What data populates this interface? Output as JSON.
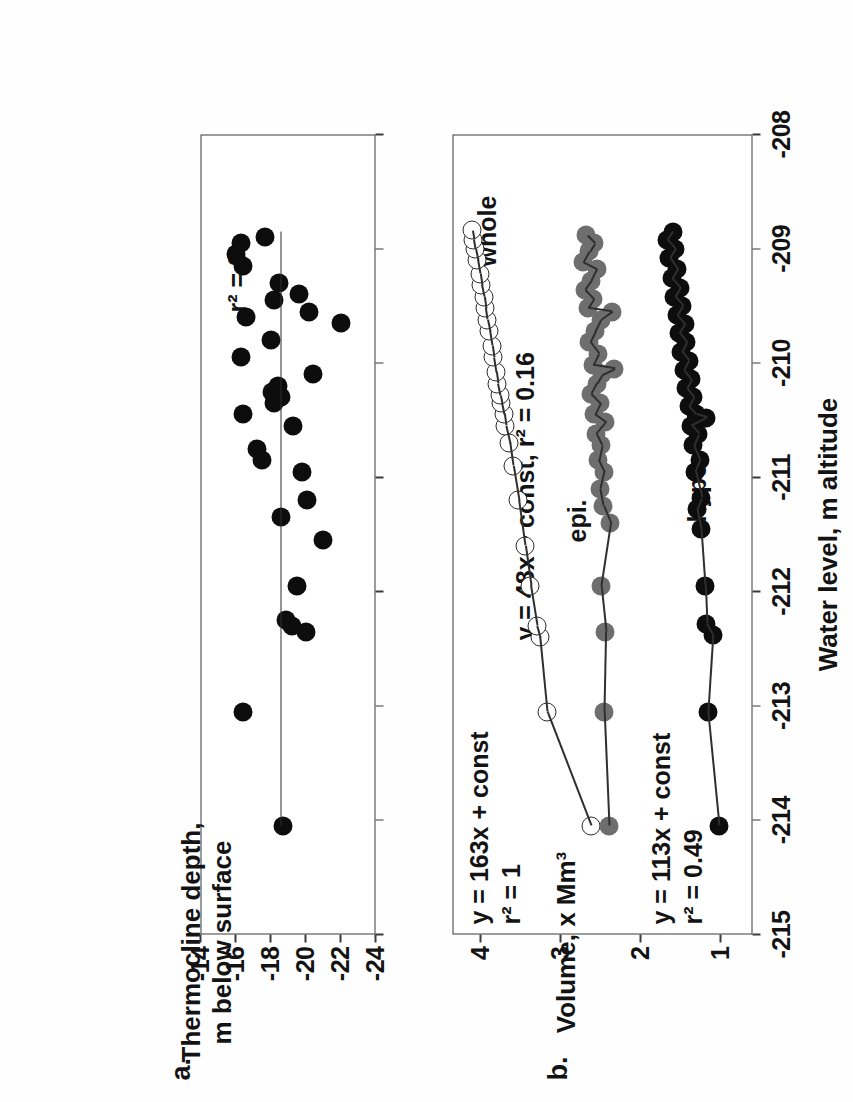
{
  "figure": {
    "orientation": "rotated-90-ccw",
    "shared_x_axis": {
      "title": "Water level, m altitude",
      "ticks": [
        "-215",
        "-214",
        "-213",
        "-212",
        "-211",
        "-210",
        "-209",
        "-208"
      ],
      "min": -215,
      "max": -208
    },
    "panels": [
      {
        "letter": "a.",
        "y_axis": {
          "title_line1": "Thermocline depth,",
          "title_line2": "m below surface",
          "ticks": [
            "-14",
            "-16",
            "-18",
            "-20",
            "-22",
            "-24"
          ],
          "min": -24,
          "max": -14
        },
        "annotations": [
          {
            "name": "r-squared",
            "text": "r² = 0"
          }
        ]
      },
      {
        "letter": "b.",
        "y_axis": {
          "title": "Volume, x Mm³",
          "ticks": [
            "1",
            "2",
            "3",
            "4"
          ],
          "min": 0.6,
          "max": 4.35
        },
        "annotations": [
          {
            "name": "series-label-whole",
            "text": "whole"
          },
          {
            "name": "series-label-epi",
            "text": "epi."
          },
          {
            "name": "series-label-hypo",
            "text": "hypo."
          },
          {
            "name": "fit-whole-eq",
            "text": "y = 163x + const"
          },
          {
            "name": "fit-whole-r2",
            "text": "r² = 1"
          },
          {
            "name": "fit-epi",
            "text": "y = 48x + const, r² = 0.16"
          },
          {
            "name": "fit-hypo-eq",
            "text": "y = 113x + const"
          },
          {
            "name": "fit-hypo-r2",
            "text": "r² = 0.49"
          }
        ]
      }
    ]
  },
  "colors": {
    "marker_black": "#0d0d0d",
    "marker_gray": "#6e6e6e",
    "marker_open_fill": "#ffffff",
    "marker_open_stroke": "#2b2b2b",
    "axis": "#3a3a3a",
    "text": "#131313",
    "background": "#ffffff"
  },
  "chart_data": [
    {
      "type": "scatter",
      "panel": "a",
      "title": "",
      "xlabel": "Water level, m altitude",
      "ylabel": "Thermocline depth, m below surface",
      "xlim": [
        -215,
        -208
      ],
      "ylim": [
        -24,
        -14
      ],
      "grid": false,
      "legend": "none",
      "annotations": [
        "r² = 0"
      ],
      "series": [
        {
          "name": "thermocline depth",
          "marker": "filled-circle-black",
          "fit_line": {
            "slope": 0,
            "r2": 0,
            "label": "r² = 0"
          },
          "points": [
            [
              -214.05,
              -18.7
            ],
            [
              -213.05,
              -16.4
            ],
            [
              -212.35,
              -20.0
            ],
            [
              -212.3,
              -19.2
            ],
            [
              -212.25,
              -18.9
            ],
            [
              -211.95,
              -19.5
            ],
            [
              -211.55,
              -21.0
            ],
            [
              -211.35,
              -18.6
            ],
            [
              -211.2,
              -20.1
            ],
            [
              -210.95,
              -19.8
            ],
            [
              -210.85,
              -17.5
            ],
            [
              -210.75,
              -17.2
            ],
            [
              -210.55,
              -19.3
            ],
            [
              -210.45,
              -16.4
            ],
            [
              -210.35,
              -18.2
            ],
            [
              -210.3,
              -18.6
            ],
            [
              -210.25,
              -18.1
            ],
            [
              -210.2,
              -18.4
            ],
            [
              -210.1,
              -20.4
            ],
            [
              -209.95,
              -16.3
            ],
            [
              -209.8,
              -18.0
            ],
            [
              -209.65,
              -22.0
            ],
            [
              -209.6,
              -16.6
            ],
            [
              -209.55,
              -20.2
            ],
            [
              -209.45,
              -18.2
            ],
            [
              -209.4,
              -19.6
            ],
            [
              -209.3,
              -18.5
            ],
            [
              -209.15,
              -16.4
            ],
            [
              -209.05,
              -16.0
            ],
            [
              -208.95,
              -16.3
            ],
            [
              -208.9,
              -17.7
            ]
          ]
        }
      ]
    },
    {
      "type": "scatter",
      "panel": "b",
      "title": "",
      "xlabel": "Water level, m altitude",
      "ylabel": "Volume, x Mm³",
      "xlim": [
        -215,
        -208
      ],
      "ylim": [
        0.6,
        4.35
      ],
      "grid": false,
      "legend": "inline-labels",
      "series": [
        {
          "name": "whole",
          "marker": "open-circle",
          "fit_line": {
            "slope": 163,
            "r2": 1,
            "label": "y = 163x + const, r² = 1"
          },
          "points": [
            [
              -214.05,
              2.62
            ],
            [
              -213.05,
              3.17
            ],
            [
              -212.4,
              3.26
            ],
            [
              -212.3,
              3.3
            ],
            [
              -211.95,
              3.38
            ],
            [
              -211.6,
              3.45
            ],
            [
              -211.2,
              3.53
            ],
            [
              -210.9,
              3.6
            ],
            [
              -210.7,
              3.64
            ],
            [
              -210.55,
              3.69
            ],
            [
              -210.45,
              3.71
            ],
            [
              -210.35,
              3.74
            ],
            [
              -210.28,
              3.76
            ],
            [
              -210.18,
              3.79
            ],
            [
              -210.08,
              3.81
            ],
            [
              -209.95,
              3.84
            ],
            [
              -209.85,
              3.86
            ],
            [
              -209.72,
              3.89
            ],
            [
              -209.62,
              3.92
            ],
            [
              -209.52,
              3.94
            ],
            [
              -209.42,
              3.96
            ],
            [
              -209.32,
              3.99
            ],
            [
              -209.22,
              4.01
            ],
            [
              -209.1,
              4.04
            ],
            [
              -209.0,
              4.07
            ],
            [
              -208.92,
              4.09
            ],
            [
              -208.84,
              4.11
            ]
          ]
        },
        {
          "name": "epi.",
          "marker": "filled-circle-gray",
          "fit_line": {
            "slope": 48,
            "r2": 0.16,
            "label": "y = 48x + const, r² = 0.16"
          },
          "points": [
            [
              -214.05,
              2.4
            ],
            [
              -213.05,
              2.46
            ],
            [
              -212.35,
              2.44
            ],
            [
              -211.95,
              2.5
            ],
            [
              -211.4,
              2.38
            ],
            [
              -211.25,
              2.47
            ],
            [
              -211.1,
              2.51
            ],
            [
              -210.95,
              2.46
            ],
            [
              -210.85,
              2.53
            ],
            [
              -210.72,
              2.49
            ],
            [
              -210.62,
              2.56
            ],
            [
              -210.52,
              2.44
            ],
            [
              -210.45,
              2.58
            ],
            [
              -210.35,
              2.51
            ],
            [
              -210.27,
              2.62
            ],
            [
              -210.18,
              2.55
            ],
            [
              -210.1,
              2.48
            ],
            [
              -210.02,
              2.6
            ],
            [
              -209.92,
              2.53
            ],
            [
              -209.82,
              2.64
            ],
            [
              -209.72,
              2.57
            ],
            [
              -209.62,
              2.5
            ],
            [
              -209.52,
              2.66
            ],
            [
              -209.44,
              2.59
            ],
            [
              -209.36,
              2.7
            ],
            [
              -209.28,
              2.62
            ],
            [
              -209.18,
              2.55
            ],
            [
              -209.12,
              2.72
            ],
            [
              -209.02,
              2.64
            ],
            [
              -208.95,
              2.58
            ],
            [
              -208.88,
              2.68
            ],
            [
              -210.05,
              2.33
            ],
            [
              -209.55,
              2.36
            ]
          ]
        },
        {
          "name": "hypo.",
          "marker": "filled-circle-black",
          "fit_line": {
            "slope": 113,
            "r2": 0.49,
            "label": "y = 113x + const, r² = 0.49"
          },
          "points": [
            [
              -214.05,
              1.02
            ],
            [
              -213.05,
              1.16
            ],
            [
              -212.38,
              1.1
            ],
            [
              -212.28,
              1.18
            ],
            [
              -211.95,
              1.2
            ],
            [
              -211.45,
              1.25
            ],
            [
              -211.28,
              1.3
            ],
            [
              -211.18,
              1.24
            ],
            [
              -210.95,
              1.32
            ],
            [
              -210.85,
              1.26
            ],
            [
              -210.72,
              1.34
            ],
            [
              -210.62,
              1.28
            ],
            [
              -210.55,
              1.37
            ],
            [
              -210.45,
              1.31
            ],
            [
              -210.38,
              1.4
            ],
            [
              -210.3,
              1.34
            ],
            [
              -210.22,
              1.43
            ],
            [
              -210.14,
              1.37
            ],
            [
              -210.06,
              1.46
            ],
            [
              -209.98,
              1.4
            ],
            [
              -209.9,
              1.49
            ],
            [
              -209.82,
              1.43
            ],
            [
              -209.74,
              1.52
            ],
            [
              -209.66,
              1.45
            ],
            [
              -209.58,
              1.55
            ],
            [
              -209.5,
              1.48
            ],
            [
              -209.42,
              1.58
            ],
            [
              -209.34,
              1.51
            ],
            [
              -209.26,
              1.61
            ],
            [
              -209.18,
              1.54
            ],
            [
              -209.08,
              1.64
            ],
            [
              -209.0,
              1.57
            ],
            [
              -208.92,
              1.67
            ],
            [
              -208.85,
              1.6
            ],
            [
              -210.48,
              1.18
            ]
          ]
        }
      ]
    }
  ]
}
